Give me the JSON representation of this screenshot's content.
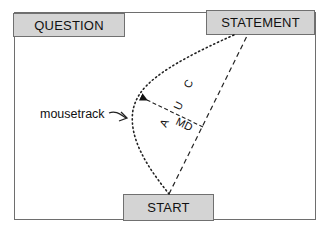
{
  "diagram": {
    "boxes": {
      "question": "QUESTION",
      "statement": "STATEMENT",
      "start": "START"
    },
    "annotations": {
      "mousetrack": "mousetrack",
      "md": "MD",
      "a": "A",
      "u": "U",
      "c": "C"
    },
    "elements": [
      {
        "type": "dotted-curve",
        "meaning": "mouse trajectory from START to STATEMENT"
      },
      {
        "type": "dashed-line",
        "meaning": "straight path from START to STATEMENT"
      },
      {
        "type": "arrow",
        "meaning": "maximum deviation (MD)"
      }
    ],
    "colors": {
      "box_fill": "#d4d4d4",
      "line": "#222222",
      "frame": "#6e6e6e"
    }
  }
}
